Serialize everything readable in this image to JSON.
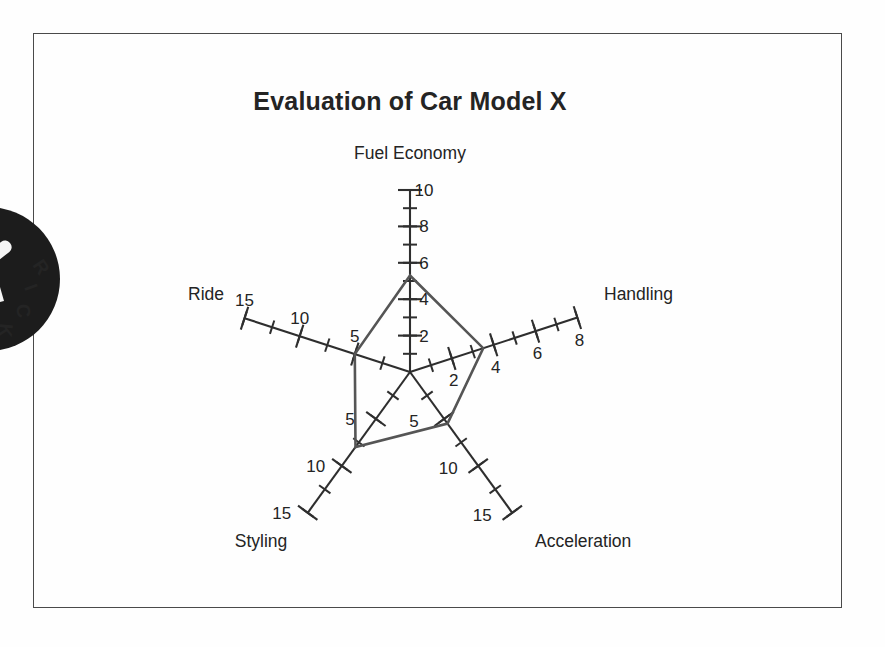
{
  "page": {
    "background_color": "#fefefe",
    "frame_color": "#4a4a4a"
  },
  "watermark": {
    "name": "circular-stamp-logo",
    "visible_text": "RICK",
    "color": "#1c1c1c",
    "description": "partially cropped dark circular stamp logo at left edge"
  },
  "chart_data": {
    "type": "radar",
    "title": "Evaluation of Car Model X",
    "xlabel": "",
    "ylabel": "",
    "grid": false,
    "legend_position": "none",
    "center": {
      "x": 410,
      "y": 372
    },
    "line_color": "#555555",
    "axis_color": "#2e2e2e",
    "categories": [
      "Fuel Economy",
      "Handling",
      "Acceleration",
      "Styling",
      "Ride"
    ],
    "values": [
      5.3,
      3.5,
      5.5,
      8.0,
      5.0
    ],
    "series": [
      {
        "name": "Car Model X",
        "values": [
          5.3,
          3.5,
          5.5,
          8.0,
          5.0
        ]
      }
    ],
    "axes": [
      {
        "label": "Fuel Economy",
        "angle_deg": 90,
        "max": 10,
        "value": 5.3,
        "pixels_per_unit": 18.2,
        "axis_length_px": 182,
        "label_x": 410,
        "label_y": 159,
        "label_anchor": "middle",
        "tick_label_dx": 14,
        "tick_label_dy": 6,
        "major_ticks": [
          {
            "value": 2,
            "label": "2"
          },
          {
            "value": 4,
            "label": "4"
          },
          {
            "value": 6,
            "label": "6"
          },
          {
            "value": 8,
            "label": "8"
          },
          {
            "value": 10,
            "label": "10"
          }
        ],
        "minor_tick_step": 1
      },
      {
        "label": "Handling",
        "angle_deg": 18,
        "max": 8,
        "value": 3.5,
        "pixels_per_unit": 22.0,
        "axis_length_px": 176,
        "label_x": 604,
        "label_y": 300,
        "label_anchor": "start",
        "tick_label_dx": 2,
        "tick_label_dy": 28,
        "major_ticks": [
          {
            "value": 2,
            "label": "2"
          },
          {
            "value": 4,
            "label": "4"
          },
          {
            "value": 6,
            "label": "6"
          },
          {
            "value": 8,
            "label": "8"
          }
        ],
        "minor_tick_step": 1
      },
      {
        "label": "Acceleration",
        "angle_deg": -54,
        "max": 15,
        "value": 5.5,
        "pixels_per_unit": 11.6,
        "axis_length_px": 174,
        "label_x": 535,
        "label_y": 547,
        "label_anchor": "start",
        "tick_label_dx": -30,
        "tick_label_dy": 8,
        "major_ticks": [
          {
            "value": 5,
            "label": "5"
          },
          {
            "value": 10,
            "label": "10"
          },
          {
            "value": 15,
            "label": "15"
          }
        ],
        "minor_tick_step": 2.5
      },
      {
        "label": "Styling",
        "angle_deg": -126,
        "max": 15,
        "value": 8.0,
        "pixels_per_unit": 11.6,
        "axis_length_px": 174,
        "label_x": 261,
        "label_y": 547,
        "label_anchor": "middle",
        "tick_label_dx": -26,
        "tick_label_dy": 6,
        "major_ticks": [
          {
            "value": 5,
            "label": "5"
          },
          {
            "value": 10,
            "label": "10"
          },
          {
            "value": 15,
            "label": "15"
          }
        ],
        "minor_tick_step": 2.5
      },
      {
        "label": "Ride",
        "angle_deg": 162,
        "max": 15,
        "value": 5.0,
        "pixels_per_unit": 11.6,
        "axis_length_px": 174,
        "label_x": 188,
        "label_y": 300,
        "label_anchor": "start",
        "tick_label_dx": 0,
        "tick_label_dy": -12,
        "major_ticks": [
          {
            "value": 5,
            "label": "5"
          },
          {
            "value": 10,
            "label": "10"
          },
          {
            "value": 15,
            "label": "15"
          }
        ],
        "minor_tick_step": 2.5
      }
    ]
  }
}
